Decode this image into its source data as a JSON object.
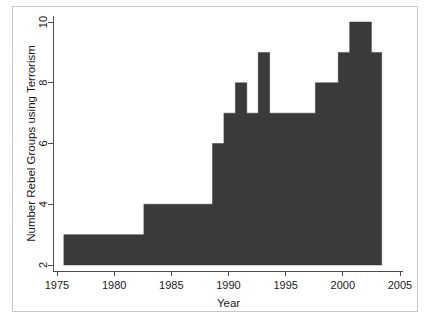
{
  "chart_data": {
    "type": "area",
    "title": "",
    "subtitle": "",
    "xlabel": "Year",
    "ylabel": "Number Rebel Groups using Terrorism",
    "xlim": [
      1974.5,
      2005.8
    ],
    "ylim": [
      2,
      10.4
    ],
    "xticks": [
      1975,
      1980,
      1985,
      1990,
      1995,
      2000,
      2005
    ],
    "xtick_labels": [
      "1975",
      "1980",
      "1985",
      "1990",
      "1995",
      "2000",
      "2005"
    ],
    "yticks": [
      2,
      4,
      6,
      8,
      10
    ],
    "ytick_labels": [
      "2",
      "4",
      "6",
      "8",
      "10"
    ],
    "grid": false,
    "legend": null,
    "fill_color": "#3a3a3a",
    "baseline": 2,
    "x_start": 1975.6,
    "x_end": 2003.4,
    "steps": [
      {
        "x_from": 1975.6,
        "x_to": 1982.6,
        "value": 3
      },
      {
        "x_from": 1982.6,
        "x_to": 1988.6,
        "value": 4
      },
      {
        "x_from": 1988.6,
        "x_to": 1989.6,
        "value": 6
      },
      {
        "x_from": 1989.6,
        "x_to": 1990.6,
        "value": 7
      },
      {
        "x_from": 1990.6,
        "x_to": 1991.6,
        "value": 8
      },
      {
        "x_from": 1991.6,
        "x_to": 1992.6,
        "value": 7
      },
      {
        "x_from": 1992.6,
        "x_to": 1993.6,
        "value": 9
      },
      {
        "x_from": 1993.6,
        "x_to": 1997.6,
        "value": 7
      },
      {
        "x_from": 1997.6,
        "x_to": 1999.6,
        "value": 8
      },
      {
        "x_from": 1999.6,
        "x_to": 2000.6,
        "value": 9
      },
      {
        "x_from": 2000.6,
        "x_to": 2002.5,
        "value": 10
      },
      {
        "x_from": 2002.5,
        "x_to": 2003.4,
        "value": 9
      }
    ],
    "series": [
      {
        "name": "Number Rebel Groups using Terrorism",
        "x": [
          1976,
          1977,
          1978,
          1979,
          1980,
          1981,
          1982,
          1983,
          1984,
          1985,
          1986,
          1987,
          1988,
          1989,
          1990,
          1991,
          1992,
          1993,
          1994,
          1995,
          1996,
          1997,
          1998,
          1999,
          2000,
          2001,
          2002,
          2003
        ],
        "values": [
          3,
          3,
          3,
          3,
          3,
          3,
          3,
          4,
          4,
          4,
          4,
          4,
          4,
          6,
          7,
          8,
          7,
          9,
          7,
          7,
          7,
          7,
          8,
          8,
          9,
          10,
          10,
          9
        ]
      }
    ]
  },
  "figure": {
    "border_color": "#c8c8c8",
    "background": "#ffffff",
    "axis_color": "#4d4d4d"
  }
}
